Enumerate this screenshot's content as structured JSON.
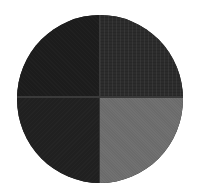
{
  "swatch": {
    "shape": "circle",
    "quadrants": [
      {
        "position": "top-left",
        "color": "#1c1c1c"
      },
      {
        "position": "top-right",
        "color": "#2c2c2c"
      },
      {
        "position": "bottom-left",
        "color": "#202020"
      },
      {
        "position": "bottom-right",
        "color": "#6b6b6b"
      }
    ],
    "divider_color": "#3a3a3a"
  }
}
